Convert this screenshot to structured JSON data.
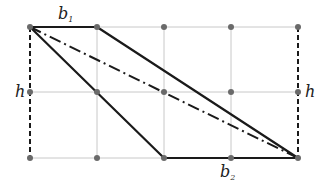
{
  "diagram": {
    "grid": {
      "columns_x": [
        30,
        97,
        164,
        231,
        298
      ],
      "rows_y": [
        27,
        92,
        158
      ],
      "line_color": "#c8c8c8",
      "dot_color": "#6a6a6a"
    },
    "labels": {
      "b1_main": "b",
      "b1_sub": "1",
      "b2_main": "b",
      "b2_sub": "2",
      "h_left": "h",
      "h_right": "h"
    },
    "colors": {
      "edge": "#1a1a1a",
      "dashed": "#1a1a1a",
      "diagonal": "#1a1a1a"
    }
  }
}
